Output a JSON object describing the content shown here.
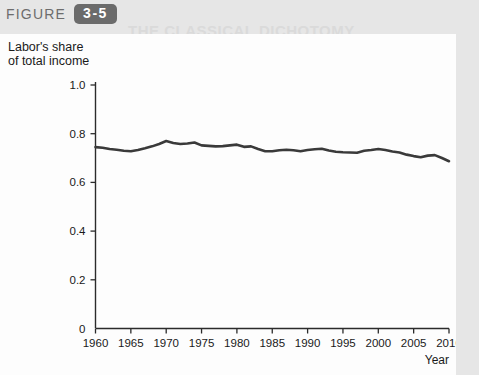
{
  "header": {
    "figure_word": "FIGURE",
    "figure_number": "3-5",
    "badge_color": "#6b6b6b"
  },
  "background_marginalia": {
    "line_title": "THE CLASSICAL DICHOTOMY",
    "line_1": "f  or     ad in  d activity and  notable",
    "line_2": "one money distribution. Therefore in CARE  assume and division",
    "line_3": "can  of   pressure   value",
    "line_4": "monetary  policy"
  },
  "chart_data": {
    "type": "line",
    "title": "",
    "xlabel": "Year",
    "ylabel": "Labor's share of total income",
    "ylabel_lines": [
      "Labor's share",
      "of total income"
    ],
    "xlim": [
      1960,
      2010
    ],
    "ylim": [
      0,
      1.0
    ],
    "grid": false,
    "legend": "none",
    "line_color": "#3a3a3a",
    "line_width": 2.6,
    "x_ticks": [
      1960,
      1965,
      1970,
      1975,
      1980,
      1985,
      1990,
      1995,
      2000,
      2005,
      2010
    ],
    "x_tick_labels": [
      "1960",
      "1965",
      "1970",
      "1975",
      "1980",
      "1985",
      "1990",
      "1995",
      "2000",
      "2005",
      "2010"
    ],
    "y_ticks": [
      0,
      0.2,
      0.4,
      0.6,
      0.8,
      1.0
    ],
    "y_tick_labels": [
      "0",
      "0.2",
      "0.4",
      "0.6",
      "0.8",
      "1.0"
    ],
    "series": [
      {
        "name": "Labor's share of total income",
        "x": [
          1960,
          1961,
          1962,
          1963,
          1964,
          1965,
          1966,
          1967,
          1968,
          1969,
          1970,
          1971,
          1972,
          1973,
          1974,
          1975,
          1976,
          1977,
          1978,
          1979,
          1980,
          1981,
          1982,
          1983,
          1984,
          1985,
          1986,
          1987,
          1988,
          1989,
          1990,
          1991,
          1992,
          1993,
          1994,
          1995,
          1996,
          1997,
          1998,
          1999,
          2000,
          2001,
          2002,
          2003,
          2004,
          2005,
          2006,
          2007,
          2008,
          2009,
          2010
        ],
        "values": [
          0.745,
          0.742,
          0.737,
          0.734,
          0.73,
          0.728,
          0.733,
          0.74,
          0.748,
          0.758,
          0.77,
          0.762,
          0.758,
          0.76,
          0.764,
          0.752,
          0.75,
          0.748,
          0.749,
          0.752,
          0.755,
          0.746,
          0.748,
          0.737,
          0.728,
          0.728,
          0.732,
          0.734,
          0.732,
          0.728,
          0.733,
          0.736,
          0.738,
          0.731,
          0.726,
          0.724,
          0.723,
          0.722,
          0.73,
          0.733,
          0.737,
          0.733,
          0.727,
          0.723,
          0.714,
          0.708,
          0.703,
          0.71,
          0.712,
          0.7,
          0.687
        ]
      }
    ]
  }
}
